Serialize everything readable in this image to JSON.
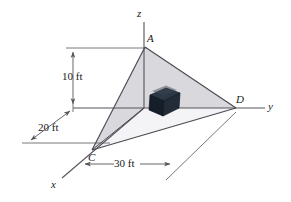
{
  "figure": {
    "background_color": "#ffffff",
    "line_color": "#55555c",
    "plate_fill_upper": "#d7d7dc",
    "plate_fill_lower": "#f2f2f4",
    "block_color": "#1b2430"
  },
  "axes": {
    "z": {
      "label": "z"
    },
    "y": {
      "label": "y"
    },
    "x": {
      "label": "x"
    }
  },
  "points": {
    "a": {
      "label": "A"
    },
    "c": {
      "label": "C"
    },
    "d": {
      "label": "D"
    }
  },
  "dimensions": {
    "height": {
      "label": "10 ft",
      "value": 10,
      "unit": "ft"
    },
    "depth": {
      "label": "20 ft",
      "value": 20,
      "unit": "ft"
    },
    "width": {
      "label": "30 ft",
      "value": 30,
      "unit": "ft"
    }
  }
}
